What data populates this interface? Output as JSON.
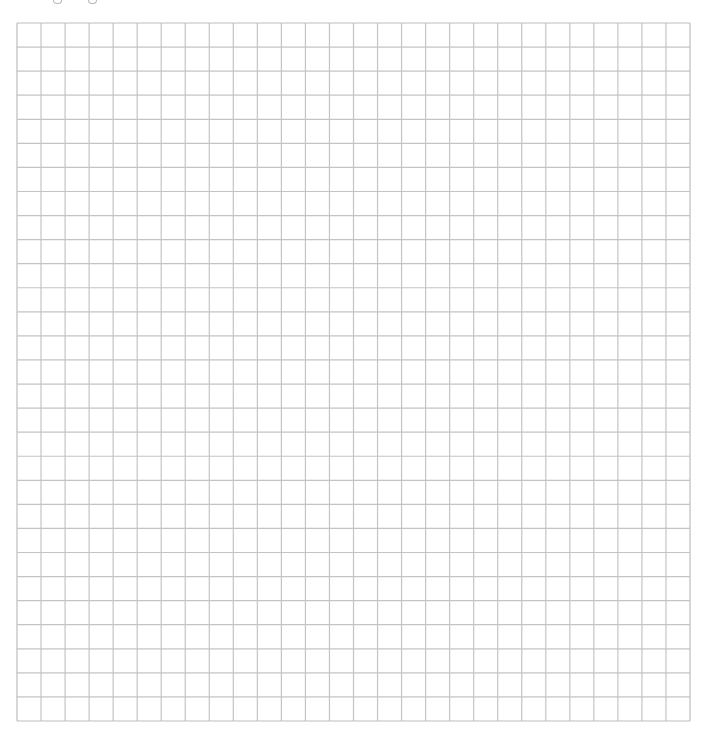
{
  "page": {
    "type": "blank-grid-worksheet",
    "background_color": "#ffffff"
  },
  "grid": {
    "columns": 28,
    "rows": 29,
    "line_color": "#c4c4c4",
    "border_color": "#bdbdbd",
    "line_width": 1.2
  },
  "top_fragments": [
    {
      "x": 53
    },
    {
      "x": 88
    }
  ]
}
